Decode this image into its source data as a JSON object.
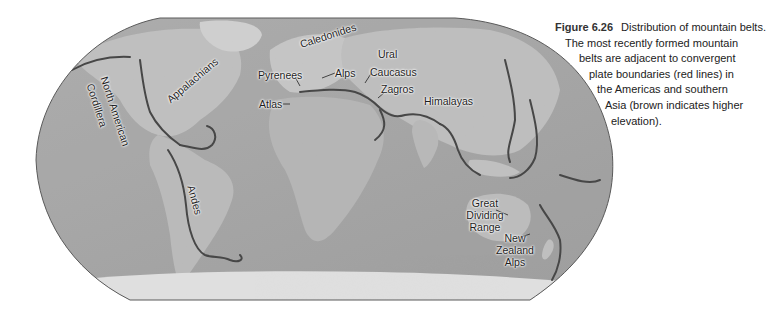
{
  "figure": {
    "number": "Figure 6.26",
    "title": "Distribution of mountain belts.",
    "caption_lines": [
      "The most recently formed mountain",
      "belts are adjacent to convergent",
      "plate boundaries (red lines) in",
      "the Americas and southern",
      "Asia (brown indicates higher",
      "elevation)."
    ]
  },
  "map": {
    "projection": "world-robinson-grayscale-relief",
    "boundary_color": "#444444",
    "ocean_color": "#a9a9a9",
    "land_color": "#bdbdbd",
    "labels": {
      "north_american_cordillera_1": "North American",
      "north_american_cordillera_2": "Cordillera",
      "appalachians": "Appalachians",
      "caledonides": "Caledonides",
      "ural": "Ural",
      "pyrenees": "Pyrenees",
      "alps": "Alps",
      "caucasus": "Caucasus",
      "atlas": "Atlas",
      "zagros": "Zagros",
      "himalayas": "Himalayas",
      "andes": "Andes",
      "great_dividing_range_1": "Great",
      "great_dividing_range_2": "Dividing",
      "great_dividing_range_3": "Range",
      "new_zealand_alps_1": "New",
      "new_zealand_alps_2": "Zealand",
      "new_zealand_alps_3": "Alps"
    }
  }
}
